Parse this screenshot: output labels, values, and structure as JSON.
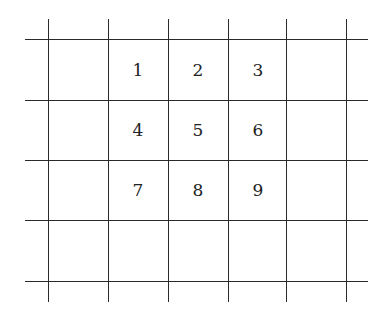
{
  "diagram": {
    "type": "grid",
    "rows": 4,
    "cols": 5,
    "vertical_lines_x": [
      48,
      108,
      168,
      228,
      286,
      346
    ],
    "horizontal_lines_y": [
      39,
      100,
      160,
      220,
      281
    ],
    "cells": [
      {
        "row": 0,
        "col": 1,
        "label": "1"
      },
      {
        "row": 0,
        "col": 2,
        "label": "2"
      },
      {
        "row": 0,
        "col": 3,
        "label": "3"
      },
      {
        "row": 1,
        "col": 1,
        "label": "4"
      },
      {
        "row": 1,
        "col": 2,
        "label": "5"
      },
      {
        "row": 1,
        "col": 3,
        "label": "6"
      },
      {
        "row": 2,
        "col": 1,
        "label": "7"
      },
      {
        "row": 2,
        "col": 2,
        "label": "8"
      },
      {
        "row": 2,
        "col": 3,
        "label": "9"
      }
    ],
    "line_color": "#2a2a2a"
  }
}
